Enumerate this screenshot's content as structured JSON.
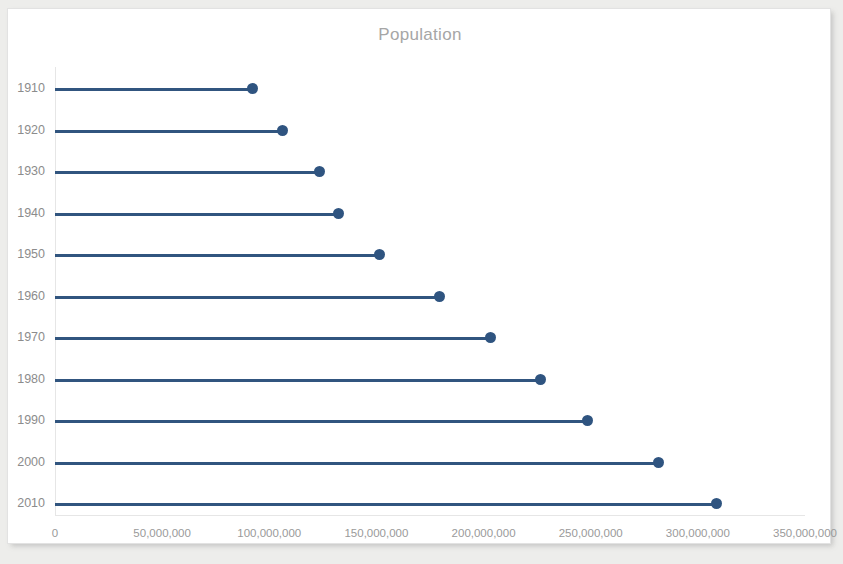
{
  "chart_data": {
    "type": "bar",
    "title": "Population",
    "subtitle": "",
    "xlabel": "",
    "ylabel": "",
    "orientation": "horizontal",
    "grid": false,
    "legend": null,
    "categories": [
      "1910",
      "1920",
      "1930",
      "1940",
      "1950",
      "1960",
      "1970",
      "1980",
      "1990",
      "2000",
      "2010"
    ],
    "values": [
      92228496,
      106021537,
      123202624,
      132164569,
      151325798,
      179323175,
      203211926,
      226545805,
      248709873,
      281421906,
      308745538
    ],
    "xlim": [
      0,
      350000000
    ],
    "xticks": [
      0,
      50000000,
      100000000,
      150000000,
      200000000,
      250000000,
      300000000,
      350000000
    ],
    "xtick_labels": [
      "0",
      "50,000,000",
      "100,000,000",
      "150,000,000",
      "200,000,000",
      "250,000,000",
      "300,000,000",
      "350,000,000"
    ],
    "series": [
      {
        "name": "Population",
        "values": [
          92228496,
          106021537,
          123202624,
          132164569,
          151325798,
          179323175,
          203211926,
          226545805,
          248709873,
          281421906,
          308745538
        ]
      }
    ]
  },
  "style": {
    "marker_color": "#2f5480",
    "line_color": "#31557f",
    "title_color": "#a6a6a6",
    "tick_color": "#9a9a9a",
    "axis_color": "#e6e6e6",
    "card_background": "#ffffff",
    "card_border": "#e2e2e2",
    "page_background": "#ededeb"
  }
}
